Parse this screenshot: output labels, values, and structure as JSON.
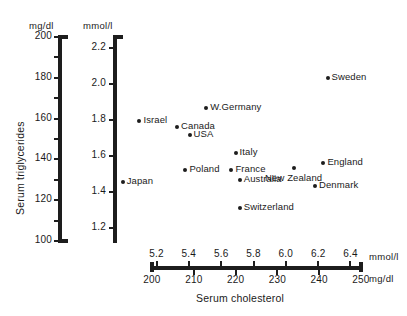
{
  "chart_data": {
    "type": "scatter",
    "title": "",
    "xlabel": "Serum cholesterol",
    "ylabel": "Serum triglycerides",
    "x_unit_primary": "mg/dl",
    "x_unit_secondary": "mmol/l",
    "y_unit_primary": "mg/dl",
    "y_unit_secondary": "mmol/l",
    "xlim": [
      200,
      250
    ],
    "ylim": [
      100,
      200
    ],
    "grid": false,
    "legend": "none",
    "x_ticks_mgdl": [
      "200",
      "210",
      "220",
      "230",
      "240",
      "250"
    ],
    "x_ticks_mmol": [
      "5.2",
      "5.4",
      "5.6",
      "5.8",
      "6.0",
      "6.2",
      "6.4"
    ],
    "x_ticks_mmol_values": [
      5.2,
      5.4,
      5.6,
      5.8,
      6.0,
      6.2,
      6.4
    ],
    "y_ticks_mgdl": [
      "200",
      "180",
      "160",
      "140",
      "120",
      "100"
    ],
    "y_ticks_mmol": [
      "2.2",
      "2.0",
      "1.8",
      "1.6",
      "1.4",
      "1.2"
    ],
    "y_ticks_mmol_values": [
      2.2,
      2.0,
      1.8,
      1.6,
      1.4,
      1.2
    ],
    "points": [
      {
        "label": "Sweden",
        "x": 242,
        "y": 180,
        "label_side": "right"
      },
      {
        "label": "W.Germany",
        "x": 213,
        "y": 165,
        "label_side": "right"
      },
      {
        "label": "Israel",
        "x": 197,
        "y": 159,
        "label_side": "right"
      },
      {
        "label": "Canada",
        "x": 206,
        "y": 156,
        "label_side": "right"
      },
      {
        "label": "USA",
        "x": 209,
        "y": 152,
        "label_side": "right"
      },
      {
        "label": "Italy",
        "x": 220,
        "y": 143,
        "label_side": "right"
      },
      {
        "label": "England",
        "x": 241,
        "y": 138,
        "label_side": "right"
      },
      {
        "label": "New Zealand",
        "x": 234,
        "y": 136,
        "label_side": "below"
      },
      {
        "label": "Poland",
        "x": 208,
        "y": 135,
        "label_side": "right"
      },
      {
        "label": "France",
        "x": 219,
        "y": 135,
        "label_side": "right"
      },
      {
        "label": "Australia",
        "x": 221,
        "y": 130,
        "label_side": "right"
      },
      {
        "label": "Japan",
        "x": 193,
        "y": 129,
        "label_side": "right"
      },
      {
        "label": "Denmark",
        "x": 239,
        "y": 127,
        "label_side": "right"
      },
      {
        "label": "Switzerland",
        "x": 221,
        "y": 116,
        "label_side": "right"
      }
    ]
  },
  "axes": {
    "y_primary_header": "mg/dl",
    "y_secondary_header": "mmol/l",
    "x_primary_unit": "mg/dl",
    "x_secondary_unit": "mmol/l",
    "y_title": "Serum triglycerides",
    "x_title": "Serum cholesterol"
  },
  "colors": {
    "ink": "#1d1d1d",
    "background": "#ffffff"
  }
}
